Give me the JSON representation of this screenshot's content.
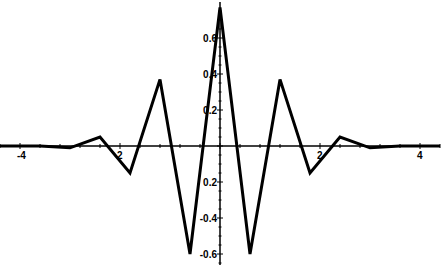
{
  "chart_data": {
    "type": "line",
    "title": "",
    "xlabel": "",
    "ylabel": "",
    "xlim": [
      -4.4,
      4.4
    ],
    "ylim": [
      -0.67,
      0.8
    ],
    "grid": false,
    "legend": null,
    "x_ticks": [
      -4,
      -2,
      2,
      4
    ],
    "x_tick_labels": [
      "-4",
      "2",
      "2",
      "4"
    ],
    "y_ticks": [
      0.6,
      0.4,
      0.2,
      -0.2,
      -0.4,
      -0.6
    ],
    "y_tick_labels": [
      "0.6",
      "0.4",
      "0.2",
      "0.2",
      "-0.4",
      "-0.6"
    ],
    "series": [
      {
        "name": "signal",
        "color": "#000000",
        "x": [
          -4.4,
          -3.6,
          -3.0,
          -2.4,
          -1.8,
          -1.2,
          -0.6,
          0.0,
          0.6,
          1.2,
          1.8,
          2.4,
          3.0,
          3.6,
          4.4
        ],
        "y": [
          0.0,
          0.0,
          -0.01,
          0.05,
          -0.15,
          0.37,
          -0.6,
          0.77,
          -0.6,
          0.37,
          -0.15,
          0.05,
          -0.01,
          0.0,
          0.0
        ]
      }
    ]
  }
}
